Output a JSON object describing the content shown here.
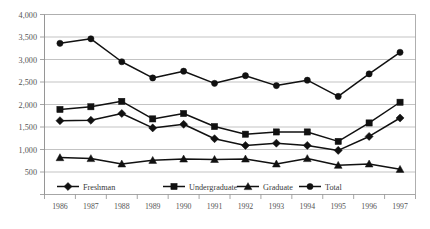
{
  "chart_data": {
    "type": "line",
    "title": "",
    "subtitle": "",
    "xlabel": "",
    "ylabel": "",
    "categories": [
      "1986",
      "1987",
      "1988",
      "1989",
      "1990",
      "1991",
      "1992",
      "1993",
      "1994",
      "1995",
      "1996",
      "1997"
    ],
    "x": [
      1986,
      1987,
      1988,
      1989,
      1990,
      1991,
      1992,
      1993,
      1994,
      1995,
      1996,
      1997
    ],
    "ylim": [
      0,
      4000
    ],
    "y_tick_values": [
      500,
      1000,
      1500,
      2000,
      2500,
      3000,
      3500,
      4000
    ],
    "y_tick_labels": [
      "500",
      "1,000",
      "1,500",
      "2,000",
      "2,500",
      "3,000",
      "3,500",
      "4,000"
    ],
    "grid": true,
    "legend_position": "bottom-inside",
    "series": [
      {
        "name": "Freshman",
        "marker": "diamond",
        "values": [
          1640,
          1650,
          1800,
          1480,
          1560,
          1240,
          1090,
          1140,
          1090,
          980,
          1290,
          1700
        ]
      },
      {
        "name": "Undergraduate",
        "marker": "square",
        "values": [
          1890,
          1950,
          2070,
          1680,
          1800,
          1510,
          1340,
          1390,
          1390,
          1180,
          1590,
          2050
        ]
      },
      {
        "name": "Graduate",
        "marker": "triangle",
        "values": [
          820,
          800,
          680,
          760,
          790,
          780,
          790,
          680,
          800,
          650,
          680,
          560
        ]
      },
      {
        "name": "Total",
        "marker": "circle",
        "values": [
          3360,
          3460,
          2950,
          2590,
          2740,
          2470,
          2640,
          2420,
          2540,
          2180,
          2680,
          3160
        ]
      }
    ]
  },
  "legend": {
    "items": [
      {
        "label": "Freshman",
        "marker": "diamond"
      },
      {
        "label": "Undergraduate",
        "marker": "square"
      },
      {
        "label": "Graduate",
        "marker": "triangle"
      },
      {
        "label": "Total",
        "marker": "circle"
      }
    ]
  },
  "colors": {
    "line": "#111111",
    "grid": "#a9a9a9",
    "frame": "#9a9a9a",
    "tick_text": "#555555",
    "background": "#ffffff"
  }
}
